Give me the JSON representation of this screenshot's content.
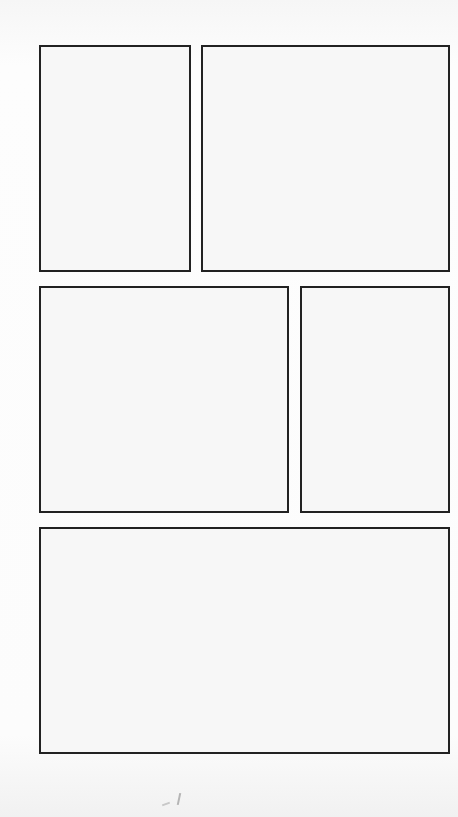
{
  "page": {
    "type": "blank comic panel template",
    "background": "#fbfbfb",
    "border_color": "#222222",
    "panel_fill": "#f7f7f7"
  },
  "panels": [
    {
      "id": 1,
      "row": 1,
      "x": 39,
      "y": 45,
      "w": 152,
      "h": 227
    },
    {
      "id": 2,
      "row": 1,
      "x": 201,
      "y": 45,
      "w": 249,
      "h": 227
    },
    {
      "id": 3,
      "row": 2,
      "x": 39,
      "y": 286,
      "w": 250,
      "h": 227
    },
    {
      "id": 4,
      "row": 2,
      "x": 300,
      "y": 286,
      "w": 150,
      "h": 227
    },
    {
      "id": 5,
      "row": 3,
      "x": 39,
      "y": 527,
      "w": 411,
      "h": 227
    }
  ]
}
